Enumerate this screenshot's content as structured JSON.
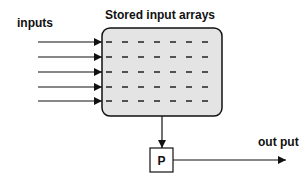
{
  "diagram": {
    "title": "Stored input arrays",
    "inputs_label": "inputs",
    "output_label": "out put",
    "processor_label": "P",
    "input_count": 5,
    "dashes_per_row": 7,
    "colors": {
      "stroke": "#111111",
      "store_fill": "#e4e4e4",
      "background": "#ffffff"
    }
  }
}
